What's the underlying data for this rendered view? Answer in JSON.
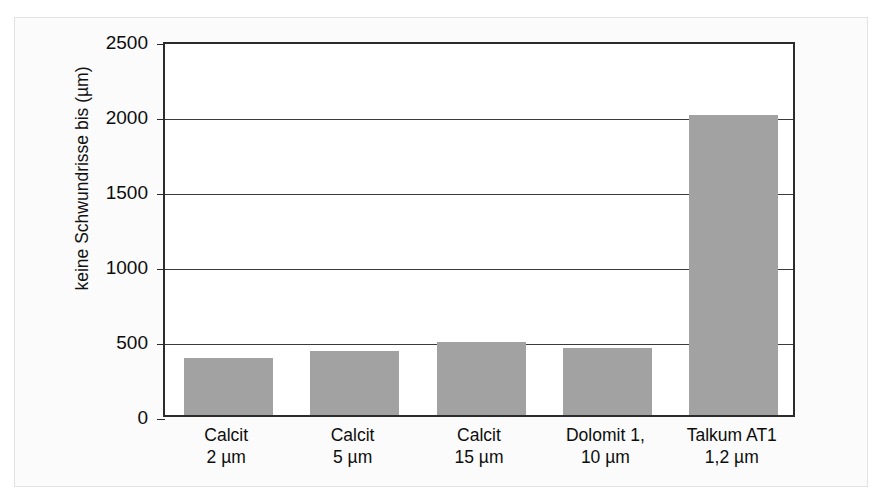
{
  "chart_data": {
    "type": "bar",
    "title": "",
    "xlabel": "",
    "ylabel": "keine Schwundrisse bis (µm)",
    "ylim": [
      0,
      2500
    ],
    "yticks": [
      2500,
      2000,
      1500,
      1000,
      500,
      0
    ],
    "ytick_labels": [
      "2500",
      "2000",
      "1500",
      "1000",
      "500",
      "0"
    ],
    "grid": "horizontal",
    "legend": "none",
    "bar_color": "#a2a2a2",
    "axis_color": "#2b2b2b",
    "categories": [
      {
        "line1": "Calcit",
        "line2": "2 µm"
      },
      {
        "line1": "Calcit",
        "line2": "5 µm"
      },
      {
        "line1": "Calcit",
        "line2": "15 µm"
      },
      {
        "line1": "Dolomit 1,",
        "line2": "10 µm"
      },
      {
        "line1": "Talkum AT1",
        "line2": "1,2 µm"
      }
    ],
    "values": [
      380,
      430,
      490,
      450,
      2000
    ]
  }
}
